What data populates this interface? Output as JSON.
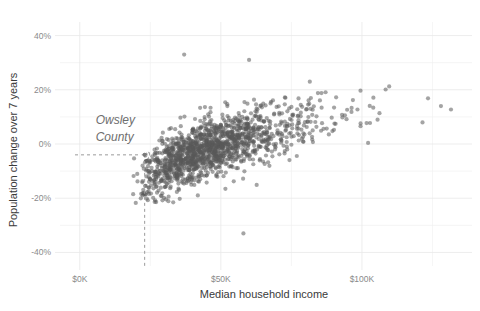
{
  "chart_data": {
    "type": "scatter",
    "title": "",
    "xlabel": "Median household income",
    "ylabel": "Population change over 7 years",
    "xlim": [
      -7000,
      139000
    ],
    "ylim": [
      -45,
      45
    ],
    "grid": true,
    "legend": null,
    "x_ticks": [
      {
        "value": 0,
        "label": "$0K"
      },
      {
        "value": 50000,
        "label": "$50K"
      },
      {
        "value": 100000,
        "label": "$100K"
      }
    ],
    "y_ticks": [
      {
        "value": 40,
        "label": "40%"
      },
      {
        "value": 20,
        "label": "20%"
      },
      {
        "value": 0,
        "label": "0%"
      },
      {
        "value": -20,
        "label": "-20%"
      },
      {
        "value": -40,
        "label": "-40%"
      }
    ],
    "x_minor_gridlines": [
      25000,
      75000,
      125000
    ],
    "y_minor_gridlines": [
      30,
      10,
      -10,
      -30
    ],
    "annotations": [
      {
        "label": "Owsley County",
        "label_lines": [
          "Owsley",
          "County"
        ],
        "x": 23000,
        "y": -4,
        "guide": "dashed-crosshair"
      }
    ],
    "point_color": "#5a5a5a",
    "point_opacity": 0.55,
    "point_radius": 2.1,
    "n_points": 1480,
    "notable_points": [
      {
        "x": 37000,
        "y": 33,
        "note": "high-change outlier"
      },
      {
        "x": 60000,
        "y": 31,
        "note": "high-change outlier"
      },
      {
        "x": 128000,
        "y": 14,
        "note": "highest income outlier"
      },
      {
        "x": 58000,
        "y": -33,
        "note": "lowest change outlier"
      },
      {
        "x": 23000,
        "y": -4,
        "note": "Owsley County (annotated)"
      }
    ]
  },
  "axis": {
    "x_title": "Median household income",
    "y_title": "Population change over 7 years"
  }
}
